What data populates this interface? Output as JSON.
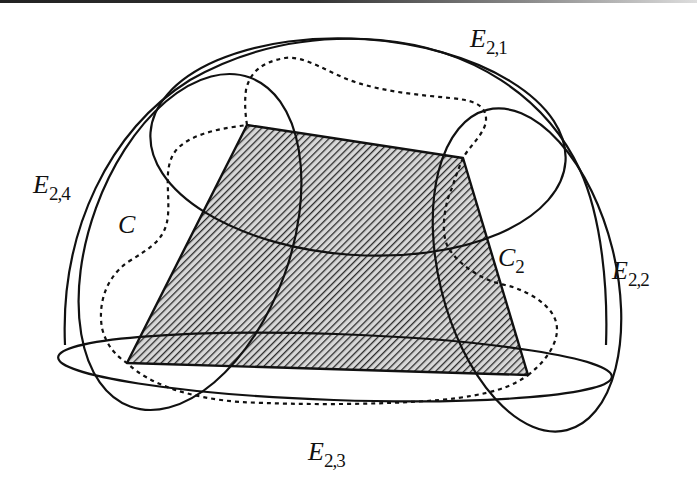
{
  "figure": {
    "type": "set-covering diagram",
    "colors": {
      "stroke": "#111111",
      "hatch": "#2a2a2a",
      "background": "#ffffff"
    },
    "labels": {
      "e21": {
        "main": "E",
        "sub": "2,1"
      },
      "e22": {
        "main": "E",
        "sub": "2,2"
      },
      "e23": {
        "main": "E",
        "sub": "2,3"
      },
      "e24": {
        "main": "E",
        "sub": "2,4"
      },
      "c": {
        "main": "C"
      },
      "c2": {
        "main": "C",
        "sub": "2"
      }
    },
    "shaded_region": {
      "shape": "quadrilateral",
      "fill": "diagonal hatching",
      "vertices": [
        [
          247,
          125
        ],
        [
          463,
          158
        ],
        [
          528,
          375
        ],
        [
          127,
          363
        ]
      ]
    },
    "ellipses": [
      {
        "id": "E2,1",
        "cx": 358,
        "cy": 147,
        "rx": 208,
        "ry": 108,
        "rotate": 4
      },
      {
        "id": "E2,2",
        "cx": 527,
        "cy": 270,
        "rx": 88,
        "ry": 165,
        "rotate": -14
      },
      {
        "id": "E2,3",
        "cx": 335,
        "cy": 367,
        "rx": 277,
        "ry": 33,
        "rotate": 2
      },
      {
        "id": "E2,4",
        "cx": 190,
        "cy": 242,
        "rx": 100,
        "ry": 175,
        "rotate": 20
      }
    ],
    "dashed_curve": "C"
  }
}
